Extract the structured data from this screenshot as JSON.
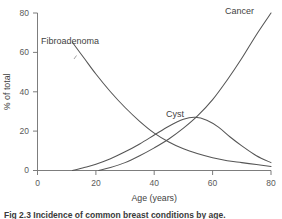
{
  "chart_data": {
    "type": "line",
    "title": "",
    "xlabel": "Age (years)",
    "ylabel": "% of total",
    "xlim": [
      0,
      80
    ],
    "ylim": [
      0,
      80
    ],
    "xticks": [
      "0",
      "20",
      "40",
      "60",
      "80"
    ],
    "yticks": [
      "0",
      "20",
      "40",
      "60",
      "80"
    ],
    "grid": false,
    "legend_position": "inline-labels",
    "series": [
      {
        "name": "Fibroadenoma",
        "label_x": 22,
        "label_y": 70,
        "x": [
          12,
          16,
          20,
          25,
          30,
          35,
          40,
          45,
          50,
          55,
          60,
          65,
          70,
          75,
          80
        ],
        "values": [
          65,
          57,
          49,
          40,
          32,
          25,
          19,
          14.5,
          11,
          8.5,
          6.5,
          5,
          4,
          3,
          2
        ]
      },
      {
        "name": "Cyst",
        "label_x": 48,
        "label_y": 34,
        "x": [
          12,
          16,
          20,
          25,
          30,
          35,
          40,
          45,
          50,
          54,
          58,
          62,
          66,
          70,
          75,
          80
        ],
        "values": [
          0,
          1.5,
          3.2,
          6,
          9.5,
          13.5,
          18,
          22.5,
          26,
          27,
          25.5,
          22,
          17,
          12.5,
          7.5,
          4
        ]
      },
      {
        "name": "Cancer",
        "label_x": 67,
        "label_y": 78,
        "x": [
          21,
          25,
          30,
          35,
          40,
          45,
          50,
          55,
          60,
          65,
          70,
          75,
          80
        ],
        "values": [
          0,
          1.5,
          4,
          7.5,
          11.5,
          16,
          21.5,
          28,
          36,
          46,
          57,
          69,
          80
        ]
      }
    ]
  },
  "colors": {
    "curve": "#555555",
    "axis": "#6e6e6e",
    "text": "#3f3f3f",
    "background": "#ffffff"
  },
  "caption": {
    "text": "Fig 2.3  Incidence of common breast conditions by age."
  }
}
